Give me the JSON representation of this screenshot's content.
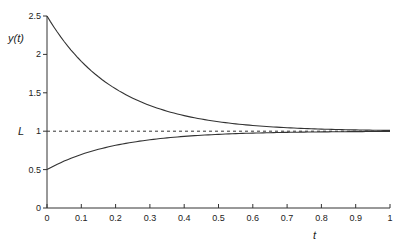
{
  "chart_data": {
    "type": "line",
    "title": "",
    "xlabel": "t",
    "ylabel": "y(t)",
    "xlim": [
      0,
      1
    ],
    "ylim": [
      0,
      2.5
    ],
    "x_ticks": [
      "0",
      "0.1",
      "0.2",
      "0.3",
      "0.4",
      "0.5",
      "0.6",
      "0.7",
      "0.8",
      "0.9",
      "1"
    ],
    "y_ticks": [
      "0",
      "0.5",
      "1",
      "1.5",
      "2",
      "2.5"
    ],
    "grid": false,
    "legend": null,
    "annotations": [
      {
        "text": "L",
        "y": 1,
        "position": "left of y-axis"
      }
    ],
    "series": [
      {
        "name": "upper solution",
        "style": "solid",
        "x": [
          0,
          0.1,
          0.2,
          0.3,
          0.4,
          0.5,
          0.6,
          0.7,
          0.8,
          0.9,
          1.0
        ],
        "values": [
          2.5,
          1.91,
          1.55,
          1.33,
          1.2,
          1.12,
          1.07,
          1.05,
          1.03,
          1.02,
          1.01
        ]
      },
      {
        "name": "lower solution",
        "style": "solid",
        "x": [
          0,
          0.1,
          0.2,
          0.3,
          0.4,
          0.5,
          0.6,
          0.7,
          0.8,
          0.9,
          1.0
        ],
        "values": [
          0.5,
          0.7,
          0.82,
          0.89,
          0.93,
          0.96,
          0.98,
          0.98,
          0.99,
          0.99,
          1.0
        ]
      },
      {
        "name": "L (equilibrium)",
        "style": "dashed",
        "x": [
          0,
          1
        ],
        "values": [
          1,
          1
        ]
      }
    ]
  }
}
